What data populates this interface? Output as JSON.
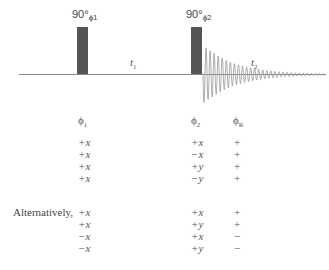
{
  "diagram": {
    "type": "NMR pulse sequence with phase cycle",
    "pulses": [
      {
        "id": "pulse1",
        "label": "90°",
        "phase_sub": "ϕ1",
        "x": 77,
        "width": 11,
        "top": 27,
        "height": 47
      },
      {
        "id": "pulse2",
        "label": "90°",
        "phase_sub": "ϕ2",
        "x": 191,
        "width": 11,
        "top": 27,
        "height": 47
      }
    ],
    "delays": [
      {
        "id": "t1",
        "label": "t",
        "sub": "1"
      },
      {
        "id": "t2",
        "label": "t",
        "sub": "2"
      }
    ],
    "colors": {
      "pulse": "#555555",
      "baseline": "#888888",
      "fid": "#999999",
      "text": "#555555"
    }
  },
  "phase_table": {
    "headers": [
      {
        "symbol": "ϕ",
        "sub": "1"
      },
      {
        "symbol": "ϕ",
        "sub": "2"
      },
      {
        "symbol": "ϕ",
        "sub": "R"
      }
    ],
    "rows": [
      {
        "phi1": "+x",
        "phi2": "+x",
        "phiR": "+"
      },
      {
        "phi1": "+x",
        "phi2": "−x",
        "phiR": "+"
      },
      {
        "phi1": "+x",
        "phi2": "+y",
        "phiR": "+"
      },
      {
        "phi1": "+x",
        "phi2": "−y",
        "phiR": "+"
      }
    ]
  },
  "alternative_table": {
    "label": "Alternatively,",
    "rows": [
      {
        "phi1": "+x",
        "phi2": "+x",
        "phiR": "+"
      },
      {
        "phi1": "+x",
        "phi2": "+y",
        "phiR": "+"
      },
      {
        "phi1": "−x",
        "phi2": "+x",
        "phiR": "−"
      },
      {
        "phi1": "−x",
        "phi2": "+y",
        "phiR": "−"
      }
    ]
  }
}
